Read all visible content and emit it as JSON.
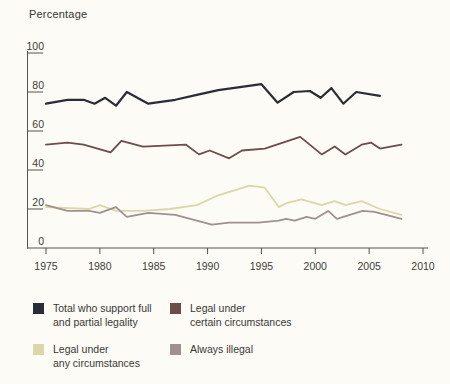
{
  "chart_data": {
    "type": "line",
    "title": "Percentage",
    "xlabel": "",
    "ylabel": "Percentage",
    "xlim": [
      1975,
      2010
    ],
    "ylim": [
      0,
      100
    ],
    "grid": false,
    "legend_position": "below",
    "x_ticks": [
      1975,
      1980,
      1985,
      1990,
      1995,
      2000,
      2005,
      2010
    ],
    "y_ticks": [
      100,
      80,
      60,
      40,
      20,
      0
    ],
    "axis_color": "#55544f",
    "text_color": "#3e3d39",
    "series": [
      {
        "id": "total",
        "name": "Total who support full and partial legality",
        "color": "#2b2d36",
        "width": 2.2,
        "points": [
          [
            1975,
            74
          ],
          [
            1977,
            76
          ],
          [
            1978.5,
            76
          ],
          [
            1979.5,
            74
          ],
          [
            1980.5,
            77
          ],
          [
            1981.5,
            73
          ],
          [
            1982.5,
            80
          ],
          [
            1984.5,
            74
          ],
          [
            1987,
            76
          ],
          [
            1989,
            78.5
          ],
          [
            1991,
            81
          ],
          [
            1993,
            82.5
          ],
          [
            1995,
            84
          ],
          [
            1996.5,
            74.5
          ],
          [
            1998,
            80
          ],
          [
            1999.5,
            80.5
          ],
          [
            2000.5,
            77
          ],
          [
            2001.5,
            82
          ],
          [
            2002.6,
            74
          ],
          [
            2003.8,
            80
          ],
          [
            2006,
            78
          ]
        ]
      },
      {
        "id": "certain",
        "name": "Legal under certain circumstances",
        "color": "#6e4c4a",
        "width": 1.8,
        "points": [
          [
            1975,
            53
          ],
          [
            1977,
            54
          ],
          [
            1978.5,
            53
          ],
          [
            1981,
            49
          ],
          [
            1982,
            55
          ],
          [
            1984,
            52
          ],
          [
            1988,
            53
          ],
          [
            1989.2,
            48
          ],
          [
            1990.2,
            50
          ],
          [
            1992,
            46
          ],
          [
            1993.2,
            50
          ],
          [
            1995.3,
            51
          ],
          [
            1998.6,
            57
          ],
          [
            2000.6,
            48
          ],
          [
            2001.8,
            52
          ],
          [
            2002.8,
            48
          ],
          [
            2004.3,
            53
          ],
          [
            2005.2,
            54
          ],
          [
            2006,
            51
          ],
          [
            2008,
            53
          ]
        ]
      },
      {
        "id": "any",
        "name": "Legal under any circumstances",
        "color": "#dbd7a8",
        "width": 1.8,
        "points": [
          [
            1975,
            21
          ],
          [
            1979,
            20
          ],
          [
            1980,
            22
          ],
          [
            1981.5,
            19
          ],
          [
            1984,
            19
          ],
          [
            1986.5,
            20
          ],
          [
            1989,
            22
          ],
          [
            1991,
            27
          ],
          [
            1993.9,
            32
          ],
          [
            1995.3,
            31
          ],
          [
            1996.6,
            21
          ],
          [
            1997.3,
            23
          ],
          [
            1998.7,
            25
          ],
          [
            2000.6,
            22
          ],
          [
            2001.8,
            24
          ],
          [
            2002.8,
            22
          ],
          [
            2004.3,
            24
          ],
          [
            2006,
            20
          ],
          [
            2008,
            17
          ]
        ]
      },
      {
        "id": "illegal",
        "name": "Always illegal",
        "color": "#a09191",
        "width": 1.8,
        "points": [
          [
            1975,
            22
          ],
          [
            1977,
            19
          ],
          [
            1979,
            19
          ],
          [
            1980,
            18
          ],
          [
            1981.5,
            21
          ],
          [
            1982.5,
            16
          ],
          [
            1984.5,
            18
          ],
          [
            1987,
            17
          ],
          [
            1989,
            14
          ],
          [
            1990.4,
            12
          ],
          [
            1992,
            13
          ],
          [
            1994.7,
            13
          ],
          [
            1996.6,
            14
          ],
          [
            1997.3,
            15
          ],
          [
            1998.1,
            14
          ],
          [
            1999.2,
            16
          ],
          [
            2000,
            15
          ],
          [
            2001.2,
            19
          ],
          [
            2002,
            15
          ],
          [
            2003.2,
            17
          ],
          [
            2004.4,
            19
          ],
          [
            2005.5,
            18.5
          ],
          [
            2008,
            15
          ]
        ]
      }
    ],
    "legend": [
      {
        "line1": "Total who support full",
        "line2": "and partial legality",
        "color": "#2b2d36"
      },
      {
        "line1": "Legal under",
        "line2": "certain circumstances",
        "color": "#6e4c4a"
      },
      {
        "line1": "Legal under",
        "line2": "any circumstances",
        "color": "#dbd7a8"
      },
      {
        "line1": "Always illegal",
        "line2": "",
        "color": "#a09191"
      }
    ]
  }
}
